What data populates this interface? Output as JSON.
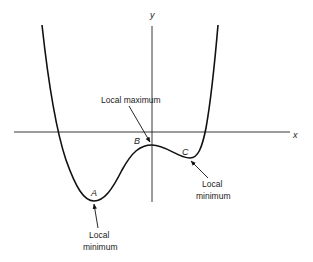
{
  "diagram": {
    "type": "function-graph",
    "axes": {
      "x_label": "x",
      "y_label": "y"
    },
    "points": [
      {
        "id": "A",
        "label": "A",
        "annotation_line1": "Local",
        "annotation_line2": "minimum",
        "kind": "local minimum"
      },
      {
        "id": "B",
        "label": "B",
        "annotation": "Local maximum",
        "kind": "local maximum"
      },
      {
        "id": "C",
        "label": "C",
        "annotation_line1": "Local",
        "annotation_line2": "minimum",
        "kind": "local minimum"
      }
    ],
    "colors": {
      "stroke": "#111111",
      "background": "#ffffff"
    }
  }
}
